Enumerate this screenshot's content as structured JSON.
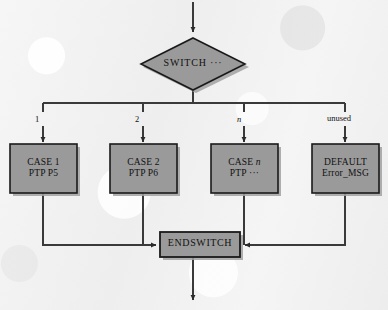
{
  "diagram": {
    "type": "flowchart",
    "colors": {
      "node_fill": "#9a9a9a",
      "node_stroke": "#1a1a1a",
      "shadow": "#9d9d9d",
      "line": "#3a3a3a",
      "background": "#f3f3f3",
      "text": "#111111"
    },
    "decision": {
      "shape": "diamond",
      "label": "SWITCH ···"
    },
    "branch_labels": [
      {
        "text": "1",
        "italic": false
      },
      {
        "text": "2",
        "italic": false
      },
      {
        "text": "n",
        "italic": true
      },
      {
        "text": "unused",
        "italic": false
      }
    ],
    "cases": [
      {
        "line1": "CASE 1",
        "line1_italic_tail": "",
        "line2": "PTP P5"
      },
      {
        "line1": "CASE 2",
        "line1_italic_tail": "",
        "line2": "PTP P6"
      },
      {
        "line1": "CASE ",
        "line1_italic_tail": "n",
        "line2": "PTP ···"
      },
      {
        "line1": "DEFAULT",
        "line1_italic_tail": "",
        "line2": "Error_MSG"
      }
    ],
    "merge": {
      "shape": "rectangle",
      "label": "ENDSWITCH"
    },
    "entry_arrow": "down-arrow-into-switch",
    "exit_arrow": "down-arrow-out-of-endswitch"
  }
}
